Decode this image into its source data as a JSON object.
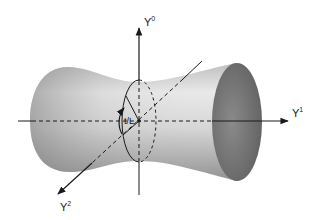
{
  "diagram": {
    "axes": [
      {
        "id": "y0",
        "base": "Y",
        "superscript": "0"
      },
      {
        "id": "y1",
        "base": "Y",
        "superscript": "1"
      },
      {
        "id": "y2",
        "base": "Y",
        "superscript": "2"
      }
    ],
    "angle_label": "t/L",
    "colors": {
      "surface_light": "#f2f2f2",
      "surface_dark": "#8a8a8a",
      "end_cap": "#6e6e6e",
      "line": "#1a1a1a"
    }
  }
}
